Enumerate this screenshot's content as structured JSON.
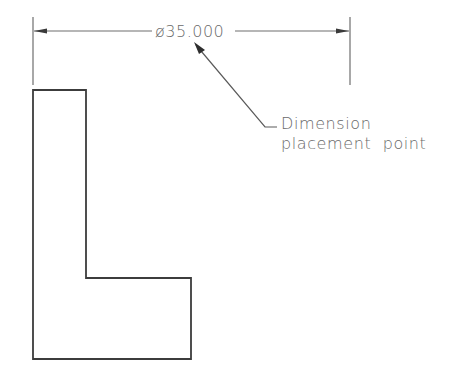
{
  "diagram": {
    "type": "cad-dimension-illustration",
    "colors": {
      "background": "#ffffff",
      "stroke": "#4a4a4a",
      "dimension_line": "#6e6e6e",
      "text": "#6a6a6a"
    },
    "dimension": {
      "label": "ø35.000",
      "symbol": "diameter",
      "value": "35.000",
      "extension_line_left": {
        "x": 33,
        "y1": 17,
        "y2": 85
      },
      "extension_line_right": {
        "x": 350,
        "y1": 17,
        "y2": 85
      },
      "dimension_line_y": 31
    },
    "annotation": {
      "line1": "Dimension",
      "line2": "placement  point",
      "leader": {
        "arrow_tip": [
          194,
          42
        ],
        "bend": [
          265,
          127
        ],
        "end": [
          277,
          127
        ]
      }
    },
    "shape": {
      "name": "L-profile",
      "points": [
        [
          33,
          90
        ],
        [
          86,
          90
        ],
        [
          86,
          278
        ],
        [
          191,
          278
        ],
        [
          191,
          359
        ],
        [
          33,
          359
        ]
      ]
    }
  }
}
